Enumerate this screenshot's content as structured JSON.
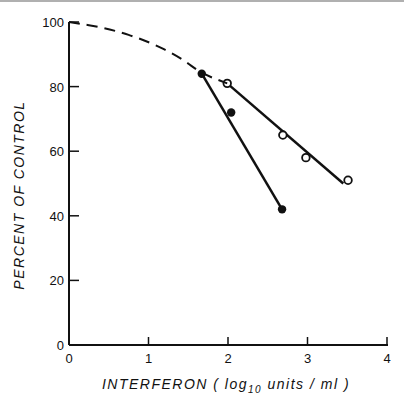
{
  "chart_data": {
    "type": "line",
    "title": "",
    "xlabel": "INTERFERON ( log10 units / ml )",
    "xlabel_parts": {
      "pre": "INTERFERON  ( log",
      "sub": "10",
      "post": " units / ml )"
    },
    "ylabel": "PERCENT OF CONTROL",
    "xlim": [
      0,
      4
    ],
    "ylim": [
      0,
      100
    ],
    "x_ticks": [
      0,
      1,
      2,
      3,
      4
    ],
    "y_ticks": [
      0,
      20,
      40,
      60,
      80,
      100
    ],
    "x_tick_labels": [
      "0",
      "1",
      "2",
      "3",
      "4"
    ],
    "y_tick_labels": [
      "0",
      "20",
      "40",
      "60",
      "80",
      "100"
    ],
    "grid": false,
    "legend": "none",
    "series": [
      {
        "name": "filled circles",
        "marker": "filled-circle",
        "points": [
          {
            "x": 1.67,
            "y": 84
          },
          {
            "x": 2.04,
            "y": 72
          },
          {
            "x": 2.68,
            "y": 42
          }
        ],
        "fit_line": [
          {
            "x": 1.67,
            "y": 84
          },
          {
            "x": 2.68,
            "y": 42
          }
        ]
      },
      {
        "name": "open circles",
        "marker": "open-circle",
        "points": [
          {
            "x": 1.99,
            "y": 81
          },
          {
            "x": 2.69,
            "y": 65
          },
          {
            "x": 2.98,
            "y": 58
          },
          {
            "x": 3.51,
            "y": 51
          }
        ],
        "fit_line": [
          {
            "x": 1.99,
            "y": 81
          },
          {
            "x": 3.45,
            "y": 50
          }
        ]
      },
      {
        "name": "dashed curve",
        "marker": "none",
        "style": "dashed",
        "points": [
          {
            "x": 0.0,
            "y": 100
          },
          {
            "x": 0.5,
            "y": 98
          },
          {
            "x": 1.0,
            "y": 94
          },
          {
            "x": 1.4,
            "y": 89
          },
          {
            "x": 1.67,
            "y": 84
          },
          {
            "x": 1.99,
            "y": 81
          }
        ]
      }
    ]
  }
}
